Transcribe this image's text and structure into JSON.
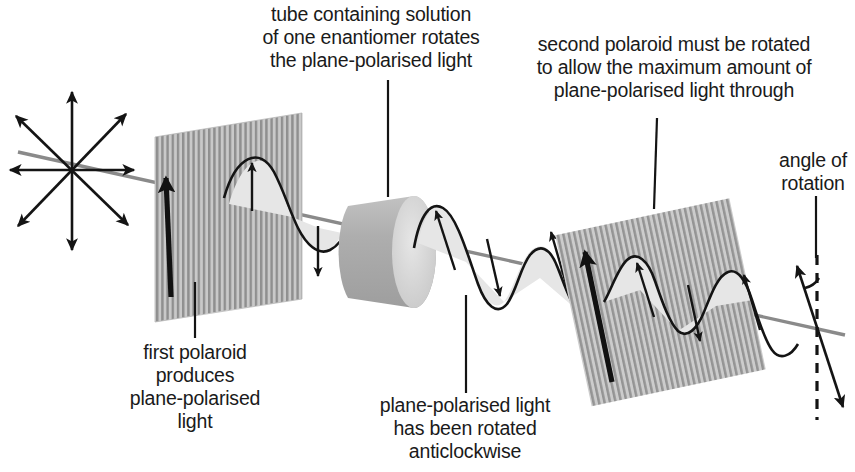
{
  "figure": {
    "background_color": "#ffffff",
    "ink_color": "#1a1a1a",
    "beam_color": "#808080",
    "polaroid_fill": "#bfbfbf",
    "polaroid_stripe": "#8c8c8c",
    "tube_fill": "#b3b3b3",
    "tube_cap_fill": "#d9d9d9",
    "wave_fill": "#e0e0e0"
  },
  "labels": {
    "tube_caption": {
      "name": "tube-caption",
      "lines": [
        "tube containing solution",
        "of one enantiomer rotates",
        "the plane-polarised light"
      ],
      "anchor_x": 371,
      "first_line_y": 21,
      "line_height": 23
    },
    "second_polaroid_caption": {
      "name": "second-polaroid-caption",
      "lines": [
        "second polaroid must be rotated",
        "to allow the maximum amount of",
        "plane-polarised light through"
      ],
      "anchor_x": 674,
      "first_line_y": 51,
      "line_height": 23
    },
    "angle_caption": {
      "name": "angle-of-rotation-caption",
      "lines": [
        "angle of",
        "rotation"
      ],
      "anchor_x": 813,
      "first_line_y": 167,
      "line_height": 23
    },
    "first_polaroid_caption": {
      "name": "first-polaroid-caption",
      "lines": [
        "first polaroid",
        "produces",
        "plane-polarised",
        "light"
      ],
      "anchor_x": 195,
      "first_line_y": 359,
      "line_height": 23
    },
    "rotated_light_caption": {
      "name": "rotated-light-caption",
      "lines": [
        "plane-polarised light",
        "has been rotated",
        "anticlockwise"
      ],
      "anchor_x": 465,
      "first_line_y": 412,
      "line_height": 23
    }
  },
  "components": {
    "unpolarised_starburst": {
      "name": "unpolarised-light-starburst",
      "center": [
        72,
        170
      ],
      "ray_count": 8,
      "description": "eight double-headed arrows radiating in all directions representing unpolarised light"
    },
    "first_polaroid": {
      "name": "first-polaroid-filter",
      "description": "vertically striped parallelogram filter, vertical transmission axis"
    },
    "sample_tube": {
      "name": "sample-tube",
      "description": "grey cylinder containing solution of one enantiomer"
    },
    "second_polaroid": {
      "name": "second-polaroid-filter",
      "description": "striped parallelogram filter rotated to match rotated plane of polarisation"
    },
    "reference_line": {
      "name": "vertical-reference-dashed-line",
      "style": "dashed"
    },
    "rotation_arc": {
      "name": "angle-of-rotation-arc"
    },
    "beam_axis": {
      "name": "light-beam-axis"
    },
    "wave_before_tube": {
      "name": "plane-polarised-wave-vertical"
    },
    "wave_after_tube": {
      "name": "plane-polarised-wave-rotated"
    }
  },
  "leaders": [
    {
      "name": "leader-to-tube",
      "x1": 388,
      "y1": 80,
      "x2": 388,
      "y2": 197
    },
    {
      "name": "leader-to-second-polaroid",
      "x1": 657,
      "y1": 118,
      "x2": 654,
      "y2": 209
    },
    {
      "name": "leader-to-first-polaroid",
      "x1": 195,
      "y1": 282,
      "x2": 195,
      "y2": 338
    },
    {
      "name": "leader-to-rotated-light",
      "x1": 466,
      "y1": 295,
      "x2": 466,
      "y2": 393
    }
  ]
}
